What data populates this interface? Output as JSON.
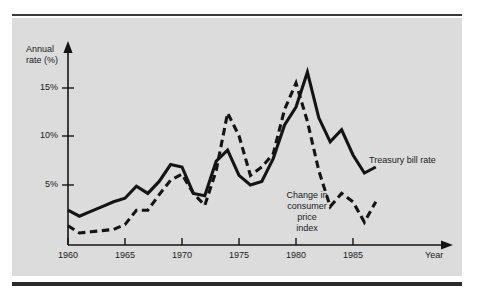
{
  "chart_data": {
    "type": "line",
    "title": "",
    "xlabel": "Year",
    "ylabel": "Annual rate (%)",
    "xlim": [
      1960,
      1988
    ],
    "ylim": [
      0,
      16.5
    ],
    "grid": false,
    "legend_position": "inline-annotations",
    "x_ticks": [
      "1960",
      "1965",
      "1970",
      "1975",
      "1980",
      "1985"
    ],
    "x_tick_values": [
      1960,
      1965,
      1970,
      1975,
      1980,
      1985
    ],
    "y_ticks": [
      "5%",
      "10%",
      "15%"
    ],
    "y_tick_values": [
      5,
      10,
      15
    ],
    "x": [
      1960,
      1961,
      1962,
      1963,
      1964,
      1965,
      1966,
      1967,
      1968,
      1969,
      1970,
      1971,
      1972,
      1973,
      1974,
      1975,
      1976,
      1977,
      1978,
      1979,
      1980,
      1981,
      1982,
      1983,
      1984,
      1985,
      1986,
      1987
    ],
    "series": [
      {
        "name": "Treasury bill rate",
        "style": "solid",
        "color": "#141414",
        "values": [
          2.9,
          2.4,
          2.8,
          3.2,
          3.6,
          3.9,
          4.9,
          4.3,
          5.3,
          6.7,
          6.5,
          4.3,
          4.1,
          7.0,
          7.9,
          5.8,
          5.0,
          5.3,
          7.2,
          10.0,
          11.5,
          14.4,
          10.6,
          8.6,
          9.6,
          7.5,
          6.0,
          6.5
        ]
      },
      {
        "name": "Change in consumer price index",
        "style": "dashed",
        "color": "#141414",
        "values": [
          1.6,
          1.0,
          1.1,
          1.2,
          1.3,
          1.7,
          2.9,
          2.9,
          4.2,
          5.4,
          5.9,
          4.3,
          3.3,
          6.2,
          11.0,
          9.1,
          5.8,
          6.5,
          7.6,
          11.3,
          13.5,
          10.3,
          6.2,
          3.2,
          4.3,
          3.6,
          1.9,
          3.6
        ]
      }
    ],
    "annotations": [
      {
        "name": "treasury-bill-rate",
        "text": "Treasury bill rate"
      },
      {
        "name": "change-in-cpi",
        "text": "Change in\nconsumer\nprice\nindex"
      }
    ]
  },
  "axis": {
    "y_title": "Annual\nrate (%)",
    "x_title": "Year"
  },
  "colors": {
    "panel_background": "#dcdcdc",
    "page_background": "#ffffff",
    "ink": "#141414",
    "rule": "#2b2b2b"
  }
}
